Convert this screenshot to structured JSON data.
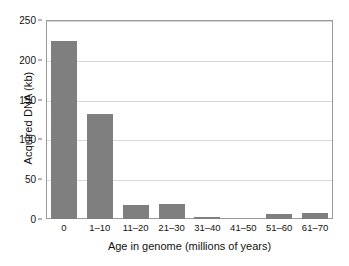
{
  "chart_data": {
    "type": "bar",
    "title": "",
    "xlabel": "Age in genome (millions of years)",
    "ylabel": "Acquired DNA (kb)",
    "categories": [
      "0",
      "1–10",
      "11–20",
      "21–30",
      "31–40",
      "41–50",
      "51–60",
      "61–70"
    ],
    "values": [
      224,
      132,
      18,
      19,
      3,
      0,
      6,
      8
    ],
    "ylim": [
      0,
      250
    ],
    "ytick_labels": [
      "0",
      "50",
      "100",
      "150",
      "200",
      "250"
    ],
    "ytick_values": [
      0,
      50,
      100,
      150,
      200,
      250
    ],
    "grid": "horizontal",
    "legend": "none",
    "bar_color": "#7f7f7f",
    "frame_color": "#9a9a9a",
    "gridline_color": "#d8d8d8",
    "background_color": "#ffffff"
  }
}
